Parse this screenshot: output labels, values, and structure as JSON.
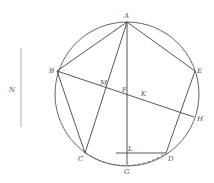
{
  "diagram": {
    "type": "geometric-construction",
    "circle": {
      "cx": 127,
      "cy": 94,
      "r": 72
    },
    "points": {
      "A": {
        "label": "A",
        "x": 127,
        "y": 22
      },
      "B": {
        "label": "B",
        "x": 57,
        "y": 71
      },
      "C": {
        "label": "C",
        "x": 85,
        "y": 153
      },
      "D": {
        "label": "D",
        "x": 166,
        "y": 153
      },
      "E": {
        "label": "E",
        "x": 195,
        "y": 71
      },
      "F": {
        "label": "F",
        "x": 127,
        "y": 95
      },
      "G": {
        "label": "G",
        "x": 127,
        "y": 165
      },
      "H": {
        "label": "H",
        "x": 194,
        "y": 117
      },
      "K": {
        "label": "K",
        "x": 143,
        "y": 98
      },
      "L": {
        "label": "L",
        "x": 127,
        "y": 153
      },
      "M": {
        "label": "M",
        "x": 106,
        "y": 88
      }
    },
    "side_segment": {
      "label": "N",
      "x": 21,
      "y1": 48,
      "y2": 127
    },
    "segments": [
      "AB",
      "AE",
      "AC",
      "AG",
      "BC",
      "ED",
      "BH",
      "LD"
    ],
    "dashed_arc": "CD via G"
  }
}
